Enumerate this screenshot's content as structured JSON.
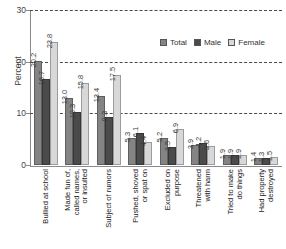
{
  "chart_data": {
    "type": "bar",
    "title": "",
    "xlabel": "",
    "ylabel": "Percent",
    "ylim": [
      0,
      30
    ],
    "yticks": [
      0,
      10,
      20,
      30
    ],
    "grid": "horizontal-dashed",
    "legend_position": "top-right",
    "categories": [
      "Bullied at school",
      "Made fun of,\ncalled names,\nor insulted",
      "Subject of rumors",
      "Pushed, shoved\nor spat on",
      "Excluded on\npurpose",
      "Threatened\nwith harm",
      "Tried to make\ndo things",
      "Had property\ndestroyed"
    ],
    "series": [
      {
        "name": "Total",
        "color": "#848484",
        "values": [
          20.2,
          13.0,
          13.4,
          5.3,
          5.2,
          3.9,
          1.9,
          1.4
        ]
      },
      {
        "name": "Male",
        "color": "#4b4b4b",
        "values": [
          16.7,
          10.3,
          9.3,
          6.1,
          3.5,
          4.2,
          1.9,
          1.3
        ]
      },
      {
        "name": "Female",
        "color": "#d8d8d8",
        "values": [
          23.8,
          15.8,
          17.5,
          4.4,
          6.9,
          3.6,
          1.9,
          1.5
        ]
      }
    ]
  }
}
